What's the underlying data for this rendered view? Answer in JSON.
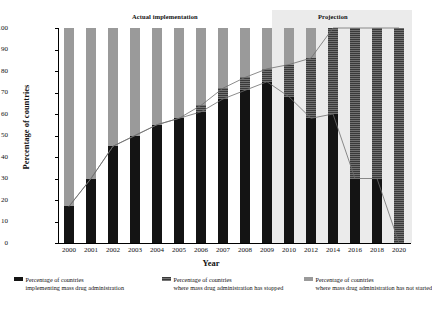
{
  "chart_data": {
    "type": "bar",
    "title": "",
    "xlabel": "Year",
    "ylabel": "Percentage of countries",
    "ylim": [
      0,
      100
    ],
    "ytick_labels": [
      "100",
      "90",
      "80",
      "70",
      "60",
      "50",
      "40",
      "30",
      "20",
      "10",
      "0"
    ],
    "yticks": [
      100,
      90,
      80,
      70,
      60,
      50,
      40,
      30,
      20,
      10,
      0
    ],
    "grid": false,
    "stacked": true,
    "legend_position": "bottom",
    "categories": [
      "2000",
      "2001",
      "2002",
      "2003",
      "2004",
      "2005",
      "2006",
      "2007",
      "2008",
      "2009",
      "2010",
      "2012",
      "2014",
      "2016",
      "2018",
      "2020"
    ],
    "series": [
      {
        "name": "Percentage of countries implementing mass drug administration",
        "color": "#141414",
        "values": [
          17,
          30,
          45,
          50,
          55,
          58,
          61,
          67,
          71,
          75,
          68,
          58,
          60,
          30,
          30,
          0
        ]
      },
      {
        "name": "Percentage of countries where mass drug administration has stopped",
        "color": "#3a3a3a",
        "values": [
          0,
          0,
          0,
          0,
          0,
          0,
          3,
          5,
          6,
          6,
          15,
          28,
          40,
          70,
          70,
          100
        ]
      },
      {
        "name": "Percentage of countries where mass drug administration has not started",
        "color": "#9a9a9a",
        "values": [
          83,
          70,
          55,
          50,
          45,
          42,
          36,
          28,
          23,
          19,
          17,
          14,
          0,
          0,
          0,
          0
        ]
      }
    ],
    "annotations": [
      {
        "id": "actual",
        "text": "Actual implementation"
      },
      {
        "id": "projection",
        "text": "Projection"
      }
    ],
    "projection_starts_at": "2010"
  },
  "axis": {
    "x_title": "Year",
    "y_title": "Percentage of countries"
  },
  "bands": {
    "actual_label": "Actual implementation",
    "projection_label": "Projection"
  },
  "legend": {
    "items": [
      {
        "head": "Percentage of countries",
        "body": "implementing mass drug administration",
        "swatch": "implementing-swatch"
      },
      {
        "head": "Percentage of countries",
        "body": "where mass drug administration has stopped",
        "swatch": "stopped-swatch"
      },
      {
        "head": "Percentage of countries",
        "body": "where mass drug administration has not started",
        "swatch": "not-started-swatch"
      }
    ]
  }
}
